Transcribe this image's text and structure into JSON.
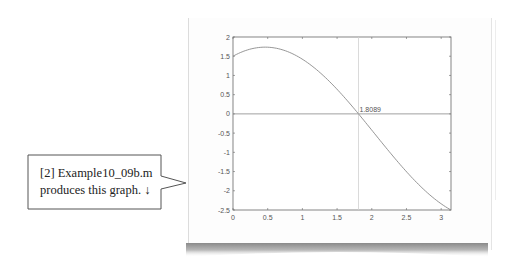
{
  "callout": {
    "line1": "[2] Example10_09b.m",
    "line2": "produces this graph. ↓",
    "arrow_icon": "down-arrow"
  },
  "chart_data": {
    "type": "line",
    "title": "",
    "xlabel": "",
    "ylabel": "",
    "function": "f(x) = 2cos(x) + sin(x) - 0.5",
    "xlim": [
      0,
      3.1416
    ],
    "ylim": [
      -2.5,
      2
    ],
    "grid": false,
    "x_ticks": [
      "0",
      "0.5",
      "1",
      "1.5",
      "2",
      "2.5",
      "3"
    ],
    "y_ticks": [
      "2",
      "1.5",
      "1",
      "0.5",
      "0",
      "-0.5",
      "-1",
      "-1.5",
      "-2",
      "-2.5"
    ],
    "series": [
      {
        "name": "f(x)",
        "x": [
          0,
          0.25,
          0.5,
          0.75,
          1.0,
          1.25,
          1.5,
          1.75,
          1.8089,
          2.0,
          2.25,
          2.5,
          2.75,
          3.0,
          3.1416
        ],
        "values": [
          1.5,
          1.685,
          1.734,
          1.645,
          0.422,
          0.578,
          -0.233,
          -0.1,
          0.0,
          -0.423,
          -0.98,
          -1.504,
          -1.969,
          -2.339,
          -2.5
        ]
      }
    ],
    "reference_lines": [
      {
        "orientation": "horizontal",
        "value": 0
      },
      {
        "orientation": "vertical",
        "value": 1.8089
      }
    ],
    "annotations": [
      {
        "text": "1.8089",
        "x": 1.8089,
        "y": 0
      }
    ]
  }
}
